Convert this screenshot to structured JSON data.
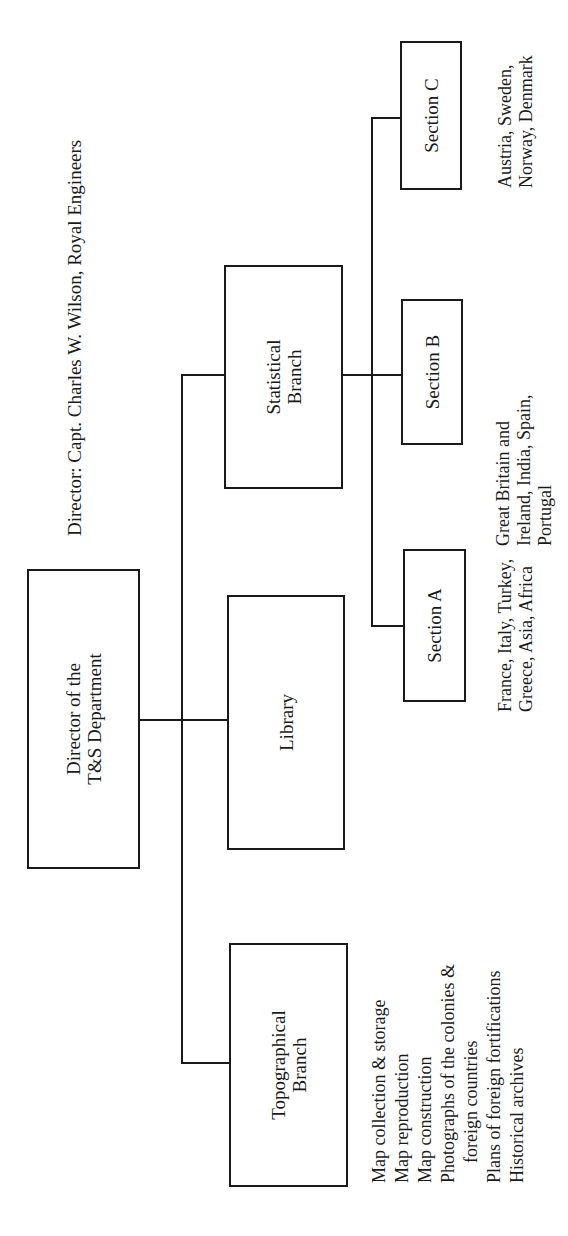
{
  "header": {
    "director_line": "Director:  Capt. Charles W. Wilson, Royal Engineers"
  },
  "nodes": {
    "director": {
      "label": "Director of the\nT&S Department"
    },
    "topographical": {
      "label": "Topographical\nBranch"
    },
    "library": {
      "label": "Library"
    },
    "statistical": {
      "label": "Statistical\nBranch"
    },
    "section_a": {
      "label": "Section A"
    },
    "section_b": {
      "label": "Section B"
    },
    "section_c": {
      "label": "Section C"
    }
  },
  "descriptions": {
    "section_a": "France, Italy, Turkey,\nGreece, Asia, Africa",
    "section_b": "Great Britain and\nIreland, India, Spain,\nPortugal",
    "section_c": "Austria, Sweden,\nNorway, Denmark",
    "topographical": [
      "Map collection & storage",
      "Map reproduction",
      "Map construction",
      "Photographs of the colonies &",
      "foreign countries",
      "Plans of foreign fortifications",
      "Historical archives"
    ]
  },
  "colors": {
    "line": "#1a1a1a",
    "background": "#ffffff"
  }
}
